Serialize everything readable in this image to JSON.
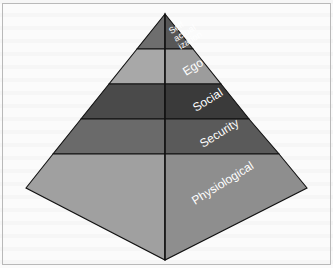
{
  "figure": {
    "type": "3d-pyramid-diagram",
    "background_color": "#fbfbfb",
    "frame_color": "#b9b9b9",
    "label_color": "#ffffff",
    "edge_color": "#111111"
  },
  "pyramid": {
    "apex": {
      "x": 165,
      "y": 14
    },
    "base_left": {
      "x": 26,
      "y": 188
    },
    "base_right": {
      "x": 307,
      "y": 188
    },
    "front_vertex": {
      "x": 165,
      "y": 260
    },
    "tier_count": 5,
    "tiers": [
      {
        "index": 1,
        "position": "top",
        "label": "Self\nactual\nization",
        "label_lines": [
          "Self",
          "actual",
          "ization"
        ],
        "right_face_color": "#575757",
        "left_face_color": "#6e6e6e",
        "label_rotation_deg": -32,
        "font_size": 9
      },
      {
        "index": 2,
        "position": "second",
        "label": "Ego",
        "label_lines": [
          "Ego"
        ],
        "right_face_color": "#9c9c9c",
        "left_face_color": "#a8a8a8",
        "label_rotation_deg": -32,
        "font_size": 12
      },
      {
        "index": 3,
        "position": "middle",
        "label": "Social",
        "label_lines": [
          "Social"
        ],
        "right_face_color": "#3a3a3a",
        "left_face_color": "#4a4a4a",
        "label_rotation_deg": -32,
        "font_size": 12
      },
      {
        "index": 4,
        "position": "fourth",
        "label": "Security",
        "label_lines": [
          "Security"
        ],
        "right_face_color": "#5a5a5a",
        "left_face_color": "#6a6a6a",
        "label_rotation_deg": -32,
        "font_size": 12
      },
      {
        "index": 5,
        "position": "base",
        "label": "Physiological",
        "label_lines": [
          "Physiological"
        ],
        "right_face_color": "#8e8e8e",
        "left_face_color": "#a0a0a0",
        "label_rotation_deg": -32,
        "font_size": 12
      }
    ]
  }
}
